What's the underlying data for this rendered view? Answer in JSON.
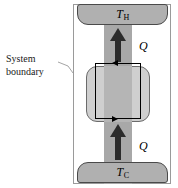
{
  "figure": {
    "type": "thermodynamics-heat-transfer-diagram",
    "caption": {
      "line1": "System",
      "line2": "boundary"
    },
    "reservoirs": {
      "hot": {
        "symbol": "T",
        "subscript": "H",
        "name": "hot-reservoir"
      },
      "cold": {
        "symbol": "T",
        "subscript": "C",
        "name": "cold-reservoir"
      }
    },
    "heat_labels": {
      "upper": "Q",
      "lower": "Q"
    },
    "colors": {
      "frame_border": "#9a9a9a",
      "band": "#a8a8a8",
      "reservoir_fill": "#b0b0b0",
      "reservoir_border": "#4a4a4a",
      "system_fill": "#cfcfcf",
      "system_border": "#6b6b6b",
      "boundary_line": "#000000",
      "arrow_fill": "#2b2b2b",
      "background": "#ffffff"
    }
  }
}
